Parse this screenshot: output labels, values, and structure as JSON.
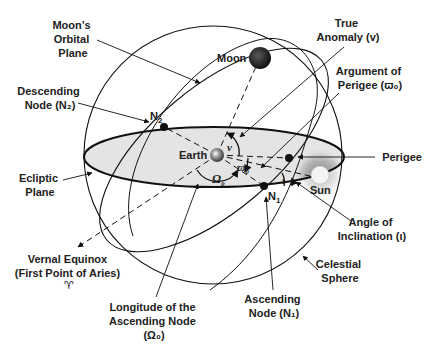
{
  "diagram": {
    "colors": {
      "line": "#111111",
      "ecliptic_fill": "#e4e4e4",
      "text": "#222222",
      "moon": "#2a2a2a",
      "sun": "#f4f4f4",
      "sun_glow": "#8a8a8a"
    },
    "bodies": {
      "moon": "Moon",
      "earth": "Earth",
      "sun": "Sun"
    },
    "points": {
      "n1": "N",
      "n1_sub": "1",
      "n2": "N",
      "n2_sub": "2"
    },
    "angles": {
      "true_anomaly": "v",
      "argument_of_perigee": "ϖ",
      "argument_of_perigee_sub": "0",
      "longitude_node": "Ω",
      "longitude_node_sub": "0",
      "inclination": "ι"
    },
    "labels": {
      "moons_orbital_plane": [
        "Moon’s",
        "Orbital",
        "Plane"
      ],
      "descending_node": [
        "Descending",
        "Node (N₂)"
      ],
      "ecliptic_plane": [
        "Ecliptic",
        "Plane"
      ],
      "vernal_equinox": [
        "Vernal Equinox",
        "(First Point of Aries)",
        "♈"
      ],
      "longitude_ascending_node": [
        "Longitude of the",
        "Ascending Node",
        "(Ω₀)"
      ],
      "ascending_node": [
        "Ascending",
        "Node (N₁)"
      ],
      "celestial_sphere": [
        "Celestial",
        "Sphere"
      ],
      "angle_of_inclination": [
        "Angle of",
        "Inclination (ι)"
      ],
      "perigee": [
        "Perigee"
      ],
      "argument_of_perigee": [
        "Argument of",
        "Perigee (ϖ₀)"
      ],
      "true_anomaly": [
        "True",
        "Anomaly (v)"
      ]
    }
  }
}
